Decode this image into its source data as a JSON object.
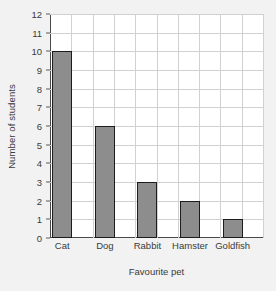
{
  "chart_data": {
    "type": "bar",
    "title": "",
    "xlabel": "Favourite pet",
    "ylabel": "Number of students",
    "categories": [
      "Cat",
      "Dog",
      "Rabbit",
      "Hamster",
      "Goldfish"
    ],
    "values": [
      10,
      6,
      3,
      2,
      1
    ],
    "ylim": [
      0,
      12
    ],
    "ytick_labels": [
      "0",
      "1",
      "2",
      "3",
      "4",
      "5",
      "6",
      "7",
      "8",
      "9",
      "10",
      "11",
      "12"
    ],
    "ytick_values": [
      0,
      1,
      2,
      3,
      4,
      5,
      6,
      7,
      8,
      9,
      10,
      11,
      12
    ],
    "ytick_step": 1,
    "grid": true,
    "grid_horizontal": true,
    "grid_vertical": true,
    "vertical_grid_columns": 10,
    "legend": false,
    "legend_position": "none",
    "series": [
      {
        "name": "Number of students",
        "values": [
          10,
          6,
          3,
          2,
          1
        ]
      }
    ],
    "colors": {
      "bar_fill": "#8d8d8d",
      "bar_border": "#1c1c1c",
      "gridline": "#d0d0d0",
      "axis_line": "#4a4a4a",
      "plot_background": "#ffffff",
      "page_background": "#f2f2f2",
      "text": "#3a3a3a"
    }
  }
}
